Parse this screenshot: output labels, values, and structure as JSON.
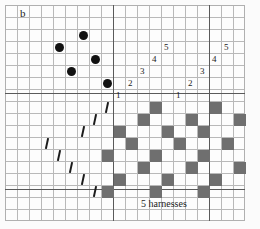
{
  "figure": {
    "panel_label": "b",
    "caption": "5 harnesses",
    "colors": {
      "grid_line": "#b9b9b9",
      "heavy_rule": "#5a5a5a",
      "dot": "#111111",
      "square_fill": "#6f6f6f",
      "slash": "#1b1b1b",
      "paper": "#fdfdfd"
    }
  },
  "grid": {
    "origin_x": 5,
    "origin_y": 5,
    "cell": 12,
    "cols": 20,
    "rows": 18
  },
  "heavy_rules": {
    "horizontal_y": [
      93,
      189
    ],
    "vertical_x": [
      113,
      209
    ]
  },
  "threading": {
    "description": "harness numbers written in repeating straight-draw runs",
    "labels": [
      {
        "text": "1",
        "col": 9,
        "row": 7
      },
      {
        "text": "2",
        "col": 10,
        "row": 6
      },
      {
        "text": "3",
        "col": 11,
        "row": 5
      },
      {
        "text": "4",
        "col": 12,
        "row": 4
      },
      {
        "text": "5",
        "col": 13,
        "row": 3
      },
      {
        "text": "1",
        "col": 14,
        "row": 7
      },
      {
        "text": "2",
        "col": 15,
        "row": 6
      },
      {
        "text": "3",
        "col": 16,
        "row": 5
      },
      {
        "text": "4",
        "col": 17,
        "row": 4
      },
      {
        "text": "5",
        "col": 18,
        "row": 3
      }
    ]
  },
  "tieup": {
    "description": "filled circles in the upper-left tie-up block",
    "dots": [
      {
        "col": 6,
        "row": 2
      },
      {
        "col": 4,
        "row": 3
      },
      {
        "col": 7,
        "row": 4
      },
      {
        "col": 5,
        "row": 5
      },
      {
        "col": 8,
        "row": 6
      }
    ]
  },
  "treadling": {
    "description": "short slanted tick marks descending to the left",
    "marks": [
      {
        "col": 8,
        "row": 8
      },
      {
        "col": 7,
        "row": 9
      },
      {
        "col": 6,
        "row": 10
      },
      {
        "col": 3,
        "row": 11
      },
      {
        "col": 4,
        "row": 12
      },
      {
        "col": 5,
        "row": 13
      },
      {
        "col": 6,
        "row": 14
      },
      {
        "col": 7,
        "row": 15
      }
    ]
  },
  "drawdown": {
    "description": "grey filled cells of the woven pattern",
    "cells": [
      {
        "col": 12,
        "row": 8
      },
      {
        "col": 17,
        "row": 8
      },
      {
        "col": 11,
        "row": 9
      },
      {
        "col": 15,
        "row": 9
      },
      {
        "col": 19,
        "row": 9
      },
      {
        "col": 9,
        "row": 10
      },
      {
        "col": 13,
        "row": 10
      },
      {
        "col": 16,
        "row": 10
      },
      {
        "col": 10,
        "row": 11
      },
      {
        "col": 14,
        "row": 11
      },
      {
        "col": 18,
        "row": 11
      },
      {
        "col": 8,
        "row": 12
      },
      {
        "col": 12,
        "row": 12
      },
      {
        "col": 16,
        "row": 12
      },
      {
        "col": 11,
        "row": 13
      },
      {
        "col": 15,
        "row": 13
      },
      {
        "col": 19,
        "row": 13
      },
      {
        "col": 9,
        "row": 14
      },
      {
        "col": 13,
        "row": 14
      },
      {
        "col": 17,
        "row": 14
      },
      {
        "col": 8,
        "row": 15
      },
      {
        "col": 12,
        "row": 15
      },
      {
        "col": 16,
        "row": 15
      }
    ]
  }
}
